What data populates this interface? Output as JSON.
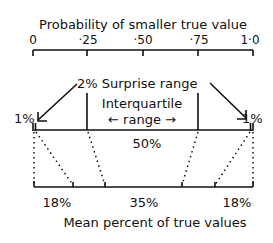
{
  "diagram": {
    "top_axis": {
      "title": "Probability of smaller true value",
      "ticks": [
        "0",
        "·25",
        "·50",
        "·75",
        "1·0"
      ]
    },
    "annotations": {
      "surprise": "2% Surprise range",
      "interquartile_line1": "Interquartile",
      "interquartile_line2": "← range →",
      "left_tail": "1%",
      "right_tail": "1%",
      "middle_pct": "50%"
    },
    "bottom_axis": {
      "title": "Mean percent of true values",
      "segments": [
        "18%",
        "35%",
        "18%"
      ]
    }
  }
}
